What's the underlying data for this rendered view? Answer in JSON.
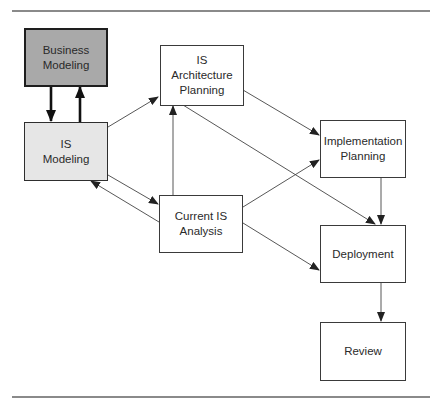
{
  "diagram": {
    "type": "flowchart",
    "colors": {
      "business_modeling_fill": "#a9a9a9",
      "is_modeling_fill": "#e6e6e6",
      "default_fill": "#ffffff",
      "stroke": "#3a3a3a"
    },
    "nodes": [
      {
        "id": "business-modeling",
        "label": "Business\nModeling"
      },
      {
        "id": "is-modeling",
        "label": "IS\nModeling"
      },
      {
        "id": "is-architecture-planning",
        "label": "IS\nArchitecture\nPlanning"
      },
      {
        "id": "current-is-analysis",
        "label": "Current IS\nAnalysis"
      },
      {
        "id": "implementation-planning",
        "label": "Implementation\nPlanning"
      },
      {
        "id": "deployment",
        "label": "Deployment"
      },
      {
        "id": "review",
        "label": "Review"
      }
    ],
    "edges": [
      {
        "from": "business-modeling",
        "to": "is-modeling",
        "style": "bold"
      },
      {
        "from": "is-modeling",
        "to": "business-modeling",
        "style": "bold"
      },
      {
        "from": "is-modeling",
        "to": "is-architecture-planning"
      },
      {
        "from": "is-modeling",
        "to": "current-is-analysis"
      },
      {
        "from": "current-is-analysis",
        "to": "is-modeling"
      },
      {
        "from": "current-is-analysis",
        "to": "is-architecture-planning"
      },
      {
        "from": "is-architecture-planning",
        "to": "implementation-planning"
      },
      {
        "from": "is-architecture-planning",
        "to": "deployment"
      },
      {
        "from": "current-is-analysis",
        "to": "implementation-planning"
      },
      {
        "from": "current-is-analysis",
        "to": "deployment"
      },
      {
        "from": "implementation-planning",
        "to": "deployment"
      },
      {
        "from": "deployment",
        "to": "review"
      }
    ]
  }
}
